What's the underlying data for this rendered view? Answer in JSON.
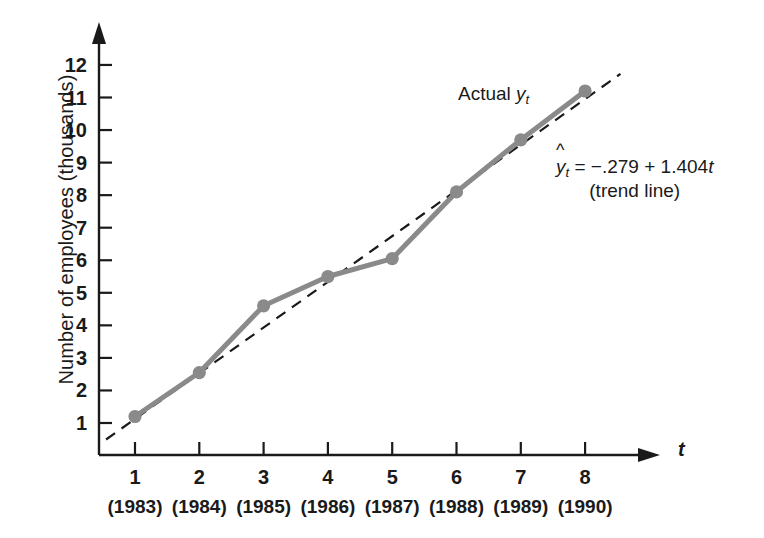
{
  "chart_data": {
    "type": "line",
    "title": "",
    "xlabel": "t",
    "ylabel": "Number of employees (thousands)",
    "x": [
      1,
      2,
      3,
      4,
      5,
      6,
      7,
      8
    ],
    "x_tick_labels": [
      "1",
      "2",
      "3",
      "4",
      "5",
      "6",
      "7",
      "8"
    ],
    "x_secondary_tick_labels": [
      "(1983)",
      "(1984)",
      "(1985)",
      "(1986)",
      "(1987)",
      "(1988)",
      "(1989)",
      "(1990)"
    ],
    "y_tick_labels": [
      "1",
      "2",
      "3",
      "4",
      "5",
      "6",
      "7",
      "8",
      "9",
      "10",
      "11",
      "12"
    ],
    "y_ticks": [
      1,
      2,
      3,
      4,
      5,
      6,
      7,
      8,
      9,
      10,
      11,
      12
    ],
    "xlim": [
      0,
      8.8
    ],
    "ylim": [
      0,
      12.8
    ],
    "grid": false,
    "legend_position": "inline-annotations",
    "series": [
      {
        "name": "Actual y_t",
        "style": "solid-with-markers",
        "color": "#8a8a8a",
        "values": [
          1.2,
          2.55,
          4.6,
          5.5,
          6.05,
          8.1,
          9.7,
          11.2
        ]
      },
      {
        "name": "Trend line",
        "style": "dashed",
        "color": "#1a1a1a",
        "equation": "y_hat_t = -0.279 + 1.404 t",
        "intercept": -0.279,
        "slope": 1.404,
        "values": [
          1.125,
          2.529,
          3.933,
          5.337,
          6.741,
          8.145,
          9.549,
          10.953
        ]
      }
    ],
    "annotations": [
      {
        "name": "actual-series-label",
        "text_prefix": "Actual ",
        "text_var": "y",
        "text_sub": "t"
      },
      {
        "name": "trend-line-equation",
        "text_hat_var": "y",
        "text_sub": "t",
        "text_equation": " = −.279 + 1.404",
        "text_equation_var": "t",
        "text_caption": "(trend line)"
      }
    ]
  },
  "axes": {
    "x_axis_symbol": "t",
    "y_axis_title": "Number of employees (thousands)"
  },
  "colors": {
    "series_actual": "#8a8a8a",
    "trend_dashed": "#1a1a1a",
    "axis": "#1a1a1a",
    "text": "#1a1a1a",
    "background": "#ffffff"
  }
}
